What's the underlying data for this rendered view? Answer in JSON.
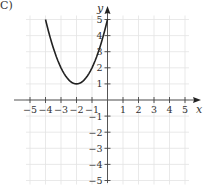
{
  "label": "C)",
  "chart_data": {
    "type": "line",
    "title": "",
    "xlabel": "x",
    "ylabel": "y",
    "xlim": [
      -5,
      5
    ],
    "ylim": [
      -5,
      5
    ],
    "grid": true,
    "x_ticks": [
      "-5",
      "-4",
      "-3",
      "-2",
      "-1",
      "1",
      "2",
      "3",
      "4",
      "5"
    ],
    "y_ticks": [
      "5",
      "4",
      "3",
      "2",
      "1",
      "-1",
      "-2",
      "-3",
      "-4",
      "-5"
    ],
    "series": [
      {
        "name": "parabola",
        "equation": "y = (x + 2)^2 + 1",
        "x": [
          -4,
          -3.5,
          -3,
          -2.5,
          -2,
          -1.5,
          -1,
          -0.5,
          0
        ],
        "y": [
          5,
          3.25,
          2,
          1.25,
          1,
          1.25,
          2,
          3.25,
          5
        ]
      }
    ],
    "vertex": [
      -2,
      1
    ]
  },
  "colors": {
    "grid": "#e3e3e3",
    "axis": "#555555",
    "curve": "#222222"
  }
}
